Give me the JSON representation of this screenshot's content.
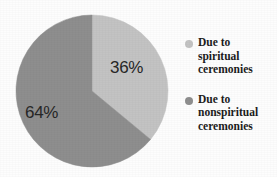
{
  "chart_data": {
    "type": "pie",
    "title": "",
    "subtitle": "",
    "xlabel": "",
    "ylabel": "",
    "grid": false,
    "legend_position": "right",
    "start_angle_deg": 0,
    "direction": "clockwise",
    "categories": [
      "Due to spiritual ceremonies",
      "Due to nonspiritual ceremonies"
    ],
    "values": [
      36,
      64
    ],
    "value_unit": "%",
    "data_labels": [
      "36%",
      "64%"
    ],
    "colors": [
      "#c3c3c3",
      "#8e8e8e"
    ],
    "slices": [
      {
        "label": "Due to spiritual ceremonies",
        "value": 36,
        "data_label": "36%",
        "color": "#c3c3c3",
        "start_deg": 0,
        "end_deg": 129.6
      },
      {
        "label": "Due to nonspiritual ceremonies",
        "value": 64,
        "data_label": "64%",
        "color": "#8e8e8e",
        "start_deg": 129.6,
        "end_deg": 360
      }
    ]
  },
  "labels": {
    "slice_one_value": "36%",
    "slice_two_value": "64%"
  },
  "legend": {
    "entries": [
      {
        "marker_color": "#c3c3c3",
        "line1": "Due to",
        "line2": "spiritual",
        "line3": "ceremonies"
      },
      {
        "marker_color": "#8e8e8e",
        "line1": "Due to",
        "line2": "nonspiritual",
        "line3": "ceremonies"
      }
    ]
  }
}
